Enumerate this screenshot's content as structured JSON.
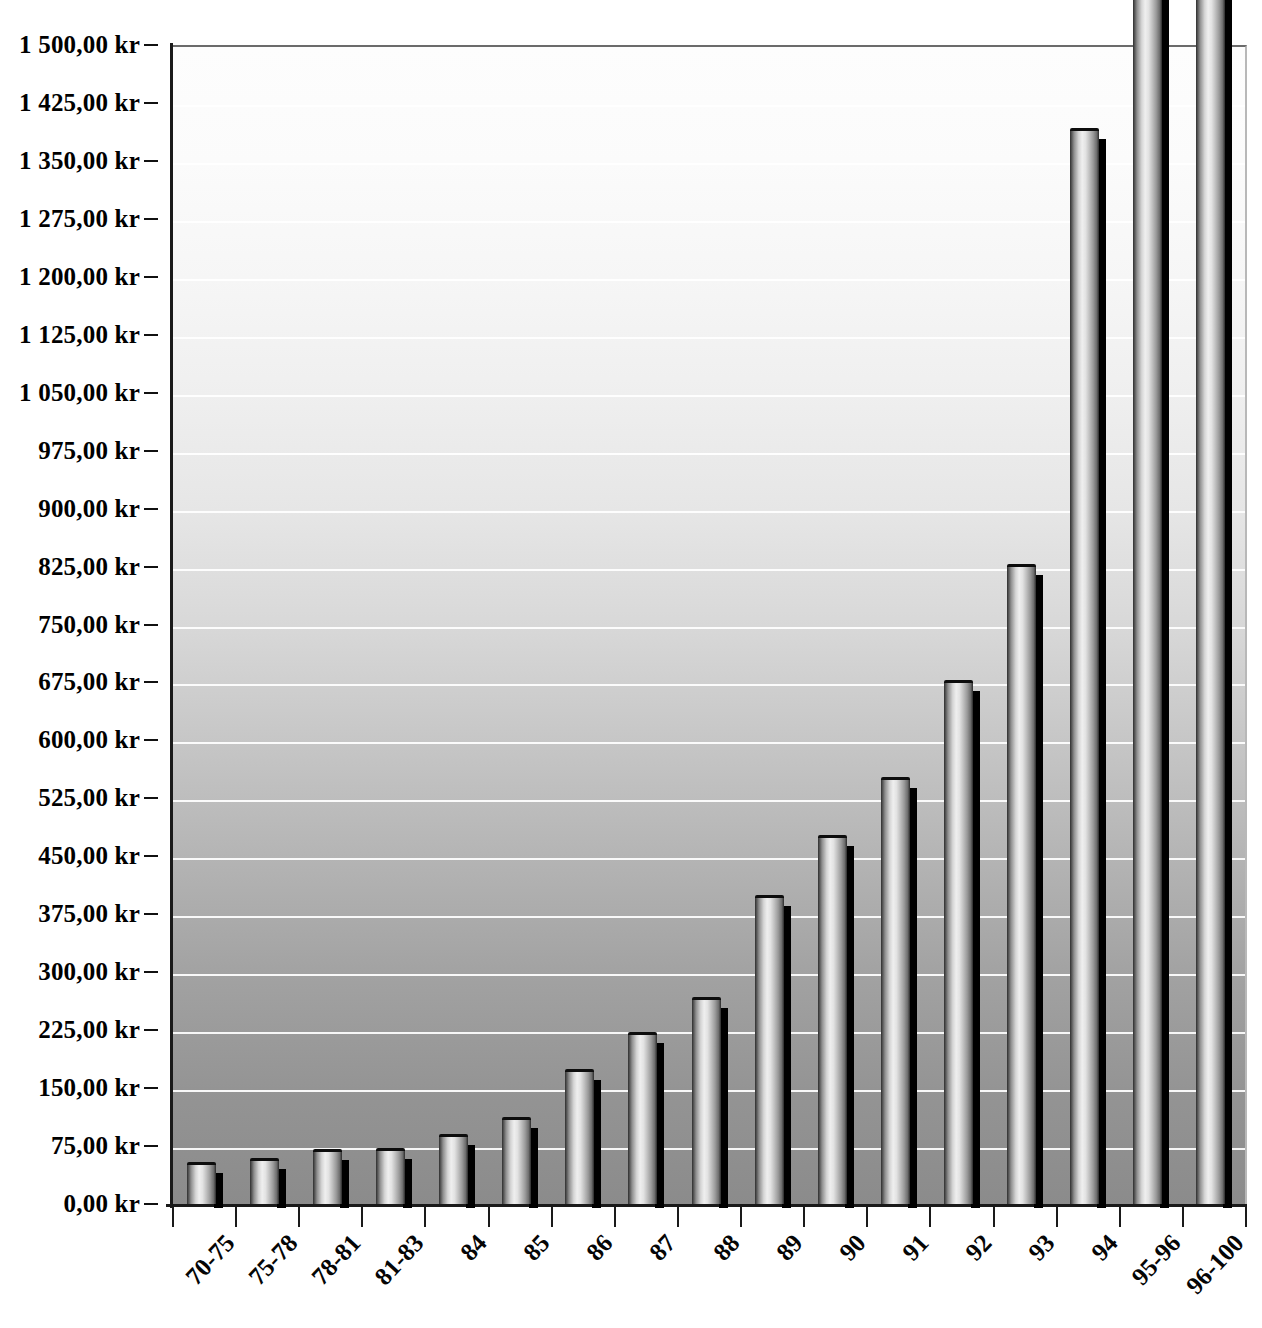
{
  "chart_data": {
    "type": "bar",
    "title": "",
    "subtitle": "",
    "xlabel": "",
    "ylabel": "",
    "currency_suffix": "kr",
    "decimal_separator": ",",
    "thousands_separator": " ",
    "grid": true,
    "legend": "none",
    "ylim": [
      0,
      1500
    ],
    "ytick_step": 75,
    "ytick_labels": [
      "1 500,00 kr",
      "1 425,00 kr",
      "1 350,00 kr",
      "1 275,00 kr",
      "1 200,00 kr",
      "1 125,00 kr",
      "1 050,00 kr",
      "975,00 kr",
      "900,00 kr",
      "825,00 kr",
      "750,00 kr",
      "675,00 kr",
      "600,00 kr",
      "525,00 kr",
      "450,00 kr",
      "375,00 kr",
      "300,00 kr",
      "225,00 kr",
      "150,00 kr",
      "75,00 kr",
      "0,00 kr"
    ],
    "ytick_values": [
      1500,
      1425,
      1350,
      1275,
      1200,
      1125,
      1050,
      975,
      900,
      825,
      750,
      675,
      600,
      525,
      450,
      375,
      300,
      225,
      150,
      75,
      0
    ],
    "categories": [
      "70-75",
      "75-78",
      "78-81",
      "81-83",
      "84",
      "85",
      "86",
      "87",
      "88",
      "89",
      "90",
      "91",
      "92",
      "93",
      "94",
      "95-96",
      "96-100"
    ],
    "values": [
      55,
      60,
      71,
      73,
      90,
      113,
      175,
      222,
      268,
      400,
      478,
      553,
      678,
      828,
      1392,
      1720,
      1700
    ],
    "clipped_above_axis": [
      "95-96",
      "96-100"
    ]
  },
  "style": {
    "bar_fill_highlight": "#efefef",
    "bar_fill_shade": "#2a2a2a",
    "bar_outline": "#0d0d0d",
    "bar_shadow": "#000000",
    "gridline_color": "#ffffff",
    "plot_bg_top": "#fdfdfd",
    "plot_bg_bottom": "#8b8b8b",
    "axis_color": "#1a1a1a",
    "label_color": "#000000"
  }
}
